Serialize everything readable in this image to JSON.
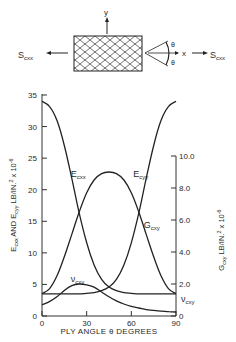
{
  "diagram": {
    "x_axis_label": "x",
    "y_axis_label": "y",
    "load_left": "S",
    "load_left_sub": "cxx",
    "load_right": "S",
    "load_right_sub": "cxx",
    "angle_symbol_top": "θ",
    "angle_symbol_bottom": "θ"
  },
  "chart_data": {
    "type": "line",
    "title": "",
    "xlabel": "PLY ANGLE θ DEGREES",
    "ylabel_left": "E cxx AND E cyy LB/IN.² x 10^-6",
    "ylabel_right": "G cxy LB/IN.² x 10^-6",
    "xlim": [
      0,
      90
    ],
    "ylim_left": [
      0,
      35
    ],
    "ylim_right": [
      0,
      10
    ],
    "x_ticks": [
      "0",
      "30",
      "60",
      "90"
    ],
    "y_ticks_left": [
      "0",
      "5",
      "10",
      "15",
      "20",
      "25",
      "30",
      "35"
    ],
    "y_ticks_right": [
      "0",
      "2.0",
      "4.0",
      "6.0",
      "8.0",
      "10.0"
    ],
    "grid": false,
    "x": [
      0,
      5,
      10,
      15,
      20,
      25,
      30,
      35,
      40,
      45,
      50,
      55,
      60,
      65,
      70,
      75,
      80,
      85,
      90
    ],
    "series": [
      {
        "name": "E cxx",
        "axis": "left",
        "values": [
          34.0,
          33.2,
          31.0,
          27.0,
          21.8,
          16.3,
          11.6,
          8.1,
          5.8,
          4.6,
          4.0,
          3.7,
          3.6,
          3.5,
          3.5,
          3.5,
          3.5,
          3.5,
          3.5
        ]
      },
      {
        "name": "E cyy",
        "axis": "left",
        "values": [
          3.5,
          3.5,
          3.5,
          3.5,
          3.5,
          3.5,
          3.6,
          3.7,
          4.0,
          4.6,
          5.8,
          8.1,
          11.6,
          16.3,
          21.8,
          27.0,
          31.0,
          33.2,
          34.0
        ]
      },
      {
        "name": "G cxy",
        "axis": "right",
        "values": [
          1.4,
          1.7,
          2.5,
          3.7,
          5.1,
          6.5,
          7.7,
          8.5,
          8.9,
          9.0,
          8.9,
          8.5,
          7.7,
          6.5,
          5.1,
          3.7,
          2.5,
          1.7,
          1.4
        ]
      },
      {
        "name": "ν cxy",
        "axis": "right",
        "values": [
          0.7,
          0.9,
          1.2,
          1.6,
          1.9,
          2.0,
          1.95,
          1.8,
          1.5,
          1.2,
          0.95,
          0.75,
          0.6,
          0.5,
          0.4,
          0.35,
          0.3,
          0.27,
          0.25
        ]
      }
    ],
    "annotations": [
      {
        "text": "E cxx",
        "x": 18,
        "y_left": 22
      },
      {
        "text": "E cyy",
        "x": 60,
        "y_left": 22
      },
      {
        "text": "G cxy",
        "x": 67,
        "y_right": 5.5
      },
      {
        "text": "ν cxy",
        "x": 18,
        "y_right": 2.1
      },
      {
        "text": "ν cxy",
        "x": 92,
        "y_right": 0.9
      }
    ],
    "legend": "none (inline labels)"
  }
}
